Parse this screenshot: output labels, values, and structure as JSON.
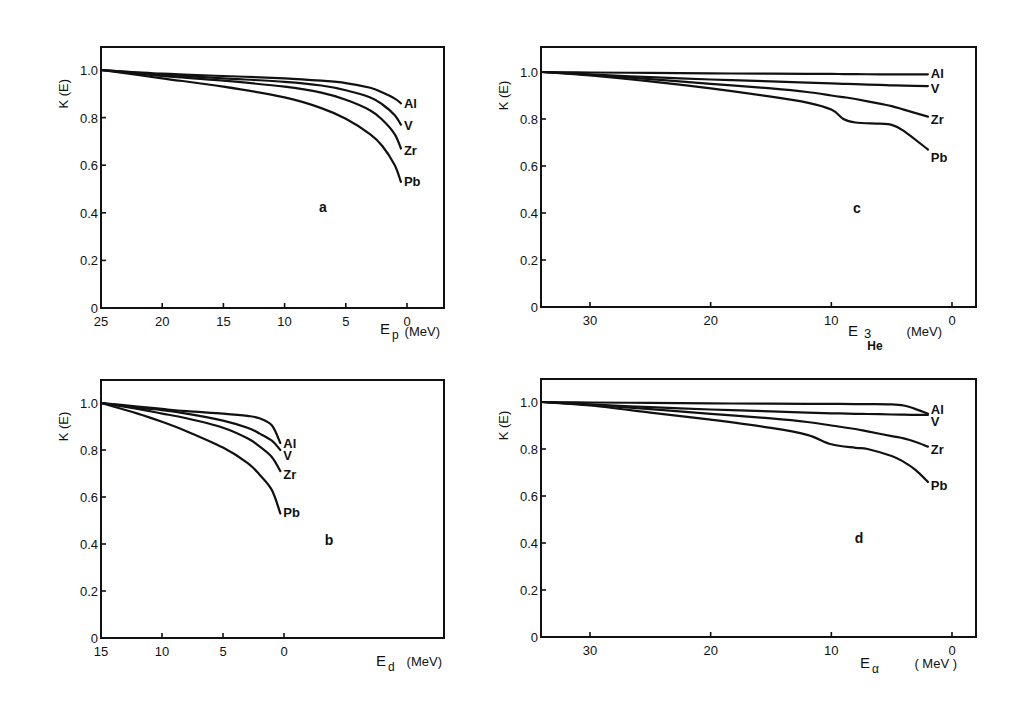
{
  "figure": {
    "y_axis_label": "K (E)",
    "x_unit_label": "(MeV)"
  },
  "chart_data": [
    {
      "type": "line",
      "panel": "a",
      "title": "",
      "xlabel": "E_p",
      "xlabel_main": "E",
      "xlabel_sub": "p",
      "xunit": "(MeV)",
      "ylabel": "K (E)",
      "xlim": [
        25,
        -3
      ],
      "ylim": [
        0,
        1.1
      ],
      "xticks": [
        25,
        20,
        15,
        10,
        5,
        0
      ],
      "xtick_labels": [
        "25",
        "20",
        "15",
        "10",
        "5",
        "0"
      ],
      "yticks": [
        0,
        0.2,
        0.4,
        0.6,
        0.8,
        1.0
      ],
      "ytick_labels": [
        "0",
        "0.2",
        "0.4",
        "0.6",
        "0.8",
        "1.0"
      ],
      "grid": false,
      "legend": "inline labels at curve ends",
      "x": [
        25,
        20,
        15,
        10,
        7,
        5,
        3,
        2,
        1,
        0.5
      ],
      "series": [
        {
          "name": "Al",
          "values": [
            1.0,
            0.985,
            0.975,
            0.965,
            0.955,
            0.945,
            0.925,
            0.905,
            0.88,
            0.86
          ]
        },
        {
          "name": "V",
          "values": [
            1.0,
            0.98,
            0.965,
            0.95,
            0.935,
            0.915,
            0.885,
            0.855,
            0.81,
            0.77
          ]
        },
        {
          "name": "Zr",
          "values": [
            1.0,
            0.975,
            0.955,
            0.93,
            0.905,
            0.875,
            0.83,
            0.79,
            0.73,
            0.67
          ]
        },
        {
          "name": "Pb",
          "values": [
            1.0,
            0.965,
            0.93,
            0.885,
            0.84,
            0.795,
            0.73,
            0.68,
            0.6,
            0.53
          ]
        }
      ],
      "label_y": {
        "Al": 0.86,
        "V": 0.77,
        "Zr": 0.665,
        "Pb": 0.535
      }
    },
    {
      "type": "line",
      "panel": "b",
      "title": "",
      "xlabel": "E_d",
      "xlabel_main": "E",
      "xlabel_sub": "d",
      "xunit": "(MeV)",
      "ylabel": "K (E)",
      "xlim": [
        15,
        -13
      ],
      "ylim": [
        0,
        1.1
      ],
      "xticks": [
        15,
        10,
        5,
        0
      ],
      "xtick_labels": [
        "15",
        "10",
        "5",
        "0"
      ],
      "yticks": [
        0,
        0.2,
        0.4,
        0.6,
        0.8,
        1.0
      ],
      "ytick_labels": [
        "0",
        "0.2",
        "0.4",
        "0.6",
        "0.8",
        "1.0"
      ],
      "grid": false,
      "legend": "inline labels at curve ends",
      "x": [
        15,
        12,
        10,
        8,
        5,
        3,
        2,
        1,
        0.3
      ],
      "series": [
        {
          "name": "Al",
          "values": [
            1.0,
            0.985,
            0.975,
            0.965,
            0.955,
            0.945,
            0.935,
            0.905,
            0.83
          ]
        },
        {
          "name": "V",
          "values": [
            1.0,
            0.98,
            0.97,
            0.955,
            0.925,
            0.895,
            0.87,
            0.84,
            0.8
          ]
        },
        {
          "name": "Zr",
          "values": [
            1.0,
            0.975,
            0.955,
            0.935,
            0.895,
            0.85,
            0.815,
            0.77,
            0.71
          ]
        },
        {
          "name": "Pb",
          "values": [
            1.0,
            0.955,
            0.92,
            0.88,
            0.81,
            0.745,
            0.695,
            0.63,
            0.53
          ]
        }
      ],
      "label_y": {
        "Al": 0.83,
        "V": 0.78,
        "Zr": 0.7,
        "Pb": 0.535
      }
    },
    {
      "type": "line",
      "panel": "c",
      "title": "",
      "xlabel": "E_3He",
      "xlabel_main": "E",
      "xlabel_sup": "3",
      "xlabel_sub": "He",
      "xunit": "(MeV)",
      "ylabel": "K (E)",
      "xlim": [
        34,
        -2
      ],
      "ylim": [
        0,
        1.1
      ],
      "xticks": [
        30,
        20,
        10,
        0
      ],
      "xtick_labels": [
        "30",
        "20",
        "10",
        "0"
      ],
      "yticks": [
        0,
        0.2,
        0.4,
        0.6,
        0.8,
        1.0
      ],
      "ytick_labels": [
        "0",
        "0.2",
        "0.4",
        "0.6",
        "0.8",
        "1.0"
      ],
      "grid": false,
      "legend": "inline labels at curve ends",
      "x": [
        34,
        30,
        25,
        20,
        15,
        12,
        10,
        9,
        8,
        6,
        5,
        4,
        2
      ],
      "series": [
        {
          "name": "Al",
          "values": [
            1.0,
            0.998,
            0.996,
            0.994,
            0.993,
            0.992,
            0.992,
            0.991,
            0.991,
            0.99,
            0.99,
            0.99,
            0.99
          ]
        },
        {
          "name": "V",
          "values": [
            1.0,
            0.99,
            0.978,
            0.968,
            0.96,
            0.955,
            0.952,
            0.95,
            0.948,
            0.945,
            0.943,
            0.942,
            0.94
          ]
        },
        {
          "name": "Zr",
          "values": [
            1.0,
            0.988,
            0.97,
            0.95,
            0.93,
            0.915,
            0.9,
            0.893,
            0.885,
            0.865,
            0.855,
            0.84,
            0.81
          ]
        },
        {
          "name": "Pb",
          "values": [
            1.0,
            0.985,
            0.96,
            0.93,
            0.895,
            0.87,
            0.84,
            0.8,
            0.785,
            0.78,
            0.775,
            0.75,
            0.67
          ]
        }
      ],
      "label_y": {
        "Al": 0.995,
        "V": 0.93,
        "Zr": 0.8,
        "Pb": 0.64
      }
    },
    {
      "type": "line",
      "panel": "d",
      "title": "",
      "xlabel": "E_alpha",
      "xlabel_main": "E",
      "xlabel_sub": "α",
      "xunit": "( MeV )",
      "ylabel": "K (E)",
      "xlim": [
        34,
        -2
      ],
      "ylim": [
        0,
        1.1
      ],
      "xticks": [
        30,
        20,
        10,
        0
      ],
      "xtick_labels": [
        "30",
        "20",
        "10",
        "0"
      ],
      "yticks": [
        0,
        0.2,
        0.4,
        0.6,
        0.8,
        1.0
      ],
      "ytick_labels": [
        "0",
        "0.2",
        "0.4",
        "0.6",
        "0.8",
        "1.0"
      ],
      "grid": false,
      "legend": "inline labels at curve ends",
      "x": [
        34,
        30,
        25,
        20,
        15,
        12,
        10,
        8,
        7,
        5,
        4,
        3,
        2
      ],
      "series": [
        {
          "name": "Al",
          "values": [
            1.0,
            0.998,
            0.996,
            0.994,
            0.993,
            0.992,
            0.992,
            0.991,
            0.991,
            0.99,
            0.985,
            0.97,
            0.95
          ]
        },
        {
          "name": "V",
          "values": [
            1.0,
            0.99,
            0.978,
            0.968,
            0.96,
            0.955,
            0.952,
            0.95,
            0.949,
            0.947,
            0.946,
            0.945,
            0.945
          ]
        },
        {
          "name": "Zr",
          "values": [
            1.0,
            0.988,
            0.97,
            0.95,
            0.93,
            0.915,
            0.9,
            0.885,
            0.875,
            0.855,
            0.845,
            0.83,
            0.81
          ]
        },
        {
          "name": "Pb",
          "values": [
            1.0,
            0.985,
            0.955,
            0.925,
            0.89,
            0.86,
            0.82,
            0.805,
            0.8,
            0.77,
            0.745,
            0.71,
            0.66
          ]
        }
      ],
      "label_y": {
        "Al": 0.97,
        "V": 0.92,
        "Zr": 0.8,
        "Pb": 0.645
      }
    }
  ],
  "panels": [
    {
      "id": "a",
      "label": "a",
      "box": {
        "left": 101,
        "top": 47,
        "right": 444,
        "bottom": 308
      },
      "x_px": {
        "at": [
          25,
          0
        ],
        "px": [
          101,
          407
        ]
      },
      "y_px": {
        "at": [
          0,
          1.0
        ],
        "px": [
          308,
          70
        ]
      },
      "label_pos": [
        323,
        212
      ],
      "xtitle_pos": [
        380,
        334
      ],
      "unit_pos": [
        440,
        336
      ]
    },
    {
      "id": "b",
      "label": "b",
      "box": {
        "left": 101,
        "top": 380,
        "right": 444,
        "bottom": 638
      },
      "x_px": {
        "at": [
          15,
          0
        ],
        "px": [
          101,
          284
        ]
      },
      "y_px": {
        "at": [
          0,
          1.0
        ],
        "px": [
          638,
          403
        ]
      },
      "label_pos": [
        329,
        545
      ],
      "xtitle_pos": [
        376,
        666
      ],
      "unit_pos": [
        442,
        666
      ]
    },
    {
      "id": "c",
      "label": "c",
      "box": {
        "left": 541,
        "top": 47,
        "right": 976,
        "bottom": 307
      },
      "x_px": {
        "at": [
          30,
          0
        ],
        "px": [
          590,
          952
        ]
      },
      "y_px": {
        "at": [
          0,
          1.0
        ],
        "px": [
          307,
          72
        ]
      },
      "label_pos": [
        857,
        213
      ],
      "xtitle_pos": [
        848,
        336
      ],
      "unit_pos": [
        942,
        336
      ]
    },
    {
      "id": "d",
      "label": "d",
      "box": {
        "left": 541,
        "top": 379,
        "right": 976,
        "bottom": 637
      },
      "x_px": {
        "at": [
          30,
          0
        ],
        "px": [
          590,
          952
        ]
      },
      "y_px": {
        "at": [
          0,
          1.0
        ],
        "px": [
          637,
          402
        ]
      },
      "label_pos": [
        859,
        543
      ],
      "xtitle_pos": [
        860,
        668
      ],
      "unit_pos": [
        957,
        668
      ]
    }
  ]
}
